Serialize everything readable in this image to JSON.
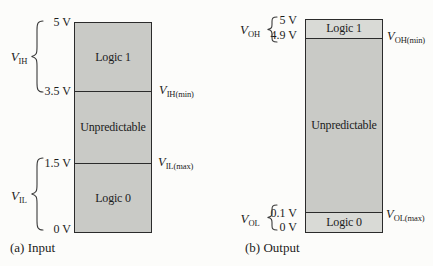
{
  "input": {
    "caption": "(a) Input",
    "regions": {
      "high": "Logic 1",
      "mid": "Unpredictable",
      "low": "Logic 0"
    },
    "volts": {
      "top": "5 V",
      "high_threshold": "3.5 V",
      "low_threshold": "1.5 V",
      "bottom": "0 V"
    },
    "v_high": {
      "base": "V",
      "sub": "IH"
    },
    "v_low": {
      "base": "V",
      "sub": "IL"
    },
    "v_high_min": {
      "base": "V",
      "sub": "IH(min)"
    },
    "v_low_max": {
      "base": "V",
      "sub": "IL(max)"
    }
  },
  "output": {
    "caption": "(b) Output",
    "regions": {
      "high": "Logic 1",
      "mid": "Unpredictable",
      "low": "Logic 0"
    },
    "volts": {
      "top": "5 V",
      "high_threshold": "4.9 V",
      "low_threshold": "0.1 V",
      "bottom": "0 V"
    },
    "v_high": {
      "base": "V",
      "sub": "OH"
    },
    "v_low": {
      "base": "V",
      "sub": "OL"
    },
    "v_high_min": {
      "base": "V",
      "sub": "OH(min)"
    },
    "v_low_max": {
      "base": "V",
      "sub": "OL(max)"
    }
  },
  "colors": {
    "region_fill": "#c9cac6",
    "band_fill": "#d9dad6",
    "border": "#2b2b2b",
    "text": "#1c1c1c",
    "background": "#fcfcfa"
  }
}
